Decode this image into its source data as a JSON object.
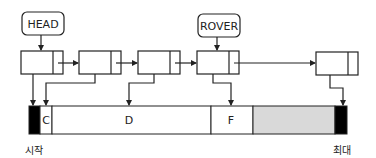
{
  "pointers": {
    "head": {
      "label": "HEAD"
    },
    "rover": {
      "label": "ROVER"
    }
  },
  "nodes": [
    {
      "id": "node-1",
      "points_to": "start-block"
    },
    {
      "id": "node-2",
      "points_to": "C"
    },
    {
      "id": "node-3",
      "points_to": "D"
    },
    {
      "id": "node-4",
      "points_to": "F"
    },
    {
      "id": "node-5",
      "points_to": "end-block"
    }
  ],
  "memory": {
    "segments": [
      {
        "label": "",
        "fill": "#000000"
      },
      {
        "label": "C",
        "fill": "#ffffff"
      },
      {
        "label": "D",
        "fill": "#ffffff"
      },
      {
        "label": "F",
        "fill": "#ffffff"
      },
      {
        "label": "",
        "fill": "#d9d9d9"
      },
      {
        "label": "",
        "fill": "#000000"
      }
    ],
    "start_label": "시작",
    "end_label": "최대"
  },
  "colors": {
    "line": "#222222",
    "free": "#d9d9d9",
    "sentinel": "#000000"
  }
}
